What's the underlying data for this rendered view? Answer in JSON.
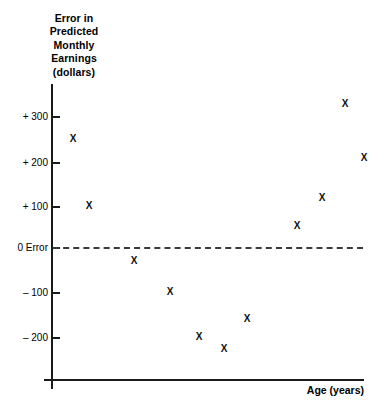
{
  "chart_data": {
    "type": "scatter",
    "title": "Error in Predicted Monthly Earnings (dollars)",
    "title_lines": [
      "Error in",
      "Predicted",
      "Monthly",
      "Earnings",
      "(dollars)"
    ],
    "xlabel": "Age (years)",
    "ylabel": "Error in Predicted Monthly Earnings (dollars)",
    "ytick_labels": [
      "+ 300",
      "+ 200",
      "+ 100",
      "0 Error",
      "– 100",
      "– 200"
    ],
    "ytick_values": [
      300,
      200,
      100,
      0,
      -100,
      -200
    ],
    "xtick_labels": [],
    "ylim": [
      -260,
      360
    ],
    "grid": false,
    "legend": null,
    "reference_line": {
      "value": 0,
      "label": "0 Error",
      "style": "dashed"
    },
    "marker_symbol": "X",
    "points": [
      {
        "x": 1,
        "y": 248
      },
      {
        "x": 2,
        "y": 95
      },
      {
        "x": 3,
        "y": -30
      },
      {
        "x": 4,
        "y": -100
      },
      {
        "x": 5,
        "y": -202
      },
      {
        "x": 6,
        "y": -230
      },
      {
        "x": 7,
        "y": -161
      },
      {
        "x": 8,
        "y": 50
      },
      {
        "x": 9,
        "y": 114
      },
      {
        "x": 10,
        "y": 327
      },
      {
        "x": 11,
        "y": 205
      }
    ],
    "pixel_points": [
      {
        "px": 73,
        "py": 139
      },
      {
        "px": 89,
        "py": 206
      },
      {
        "px": 134,
        "py": 261
      },
      {
        "px": 170,
        "py": 292
      },
      {
        "px": 199,
        "py": 337
      },
      {
        "px": 224,
        "py": 349
      },
      {
        "px": 247,
        "py": 319
      },
      {
        "px": 297,
        "py": 226
      },
      {
        "px": 322,
        "py": 198
      },
      {
        "px": 345,
        "py": 104
      },
      {
        "px": 364,
        "py": 158
      }
    ],
    "ytick_pixels": [
      117,
      163,
      207,
      248,
      293,
      338
    ],
    "colors": {
      "background": "#ffffff",
      "axis": "#1a1a1a",
      "marker": "#111111",
      "reference_line": "#3a3a3a",
      "text": "#000000"
    }
  }
}
